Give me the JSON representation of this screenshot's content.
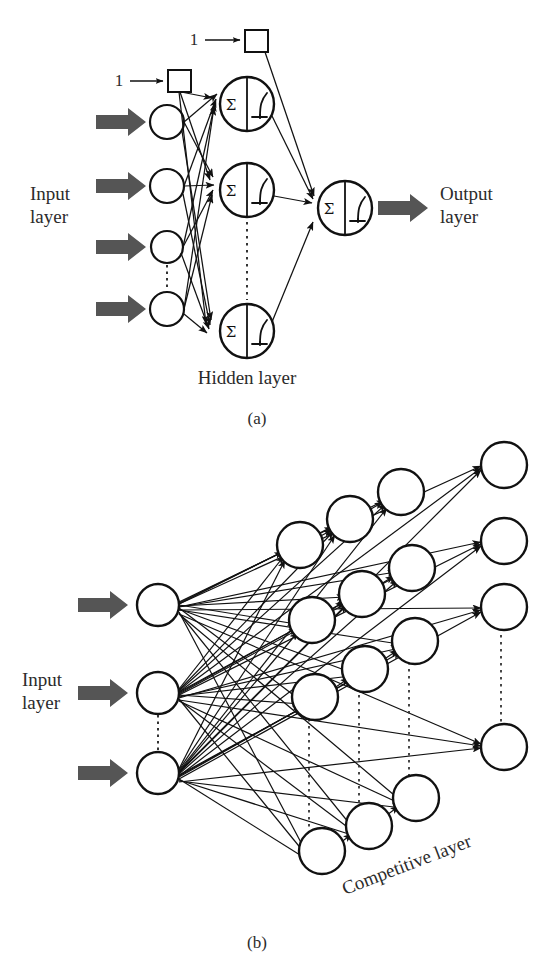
{
  "figure": {
    "panels": [
      {
        "id": "a",
        "caption": "(a)",
        "type": "multilayer-perceptron",
        "labels": {
          "input": "Input\nlayer",
          "input_line1": "Input",
          "input_line2": "layer",
          "output_line1": "Output",
          "output_line2": "layer",
          "hidden": "Hidden layer",
          "bias_value": "1"
        },
        "counts": {
          "input_nodes": 4,
          "hidden_nodes": 3,
          "output_nodes": 1,
          "bias_nodes": 2,
          "input_arrows": 4
        },
        "neuron_symbol": {
          "left": "Σ",
          "right": "sigmoid-curve"
        },
        "ellipsis": {
          "input_between": "3-4",
          "hidden_between": "2-3"
        }
      },
      {
        "id": "b",
        "caption": "(b)",
        "type": "competitive-network",
        "labels": {
          "input_line1": "Input",
          "input_line2": "layer",
          "competitive": "Competitive layer"
        },
        "counts": {
          "input_nodes": 3,
          "competitive_rows": 4,
          "competitive_cols": 3,
          "input_arrows": 3
        },
        "competitive_label_rotation_deg": -21,
        "ellipsis": {
          "input_between": "2-3",
          "competitive_vertical": true
        }
      }
    ],
    "colors": {
      "stroke": "#1a1a1a",
      "node_fill": "#ffffff",
      "thick_arrow": "#555555",
      "dotted": "#333333",
      "background": "#ffffff",
      "text": "#2b2b2b"
    }
  }
}
